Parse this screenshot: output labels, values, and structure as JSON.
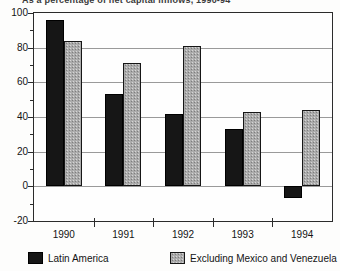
{
  "chart_data": {
    "type": "bar",
    "title": "As a percentage of net capital inflows, 1990-94",
    "title_clipped": true,
    "categories": [
      "1990",
      "1991",
      "1992",
      "1993",
      "1994"
    ],
    "series": [
      {
        "name": "Latin America",
        "values": [
          96,
          53,
          42,
          33,
          -7
        ],
        "color": "#161616",
        "style": "solid-black"
      },
      {
        "name": "Excluding Mexico and Venezuela",
        "values": [
          84,
          71,
          81,
          43,
          44
        ],
        "color": "#ababab",
        "style": "halftone-gray"
      }
    ],
    "ylim": [
      -20,
      100
    ],
    "yticks": [
      100,
      80,
      60,
      40,
      20,
      0,
      -20
    ],
    "ytick_minor_step": 10,
    "xlabel": "",
    "ylabel": "",
    "grid": true,
    "legend_position": "bottom"
  },
  "colors": {
    "background": "#fdfdfc",
    "bar_black": "#161616",
    "bar_gray": "#ababab",
    "gridline": "#9a9a9a",
    "axis": "#2b2b2b"
  }
}
